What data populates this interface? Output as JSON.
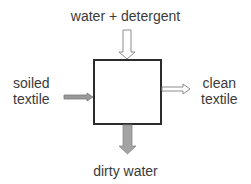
{
  "diagram": {
    "type": "process-block",
    "process_box": {
      "label": ""
    },
    "inputs": [
      {
        "id": "top",
        "lines": [
          "water + detergent"
        ],
        "arrow_style": "hollow",
        "direction": "down"
      },
      {
        "id": "left",
        "lines": [
          "soiled",
          "textile"
        ],
        "arrow_style": "filled-gray",
        "direction": "right"
      }
    ],
    "outputs": [
      {
        "id": "right",
        "lines": [
          "clean",
          "textile"
        ],
        "arrow_style": "hollow",
        "direction": "right"
      },
      {
        "id": "bottom",
        "lines": [
          "dirty water"
        ],
        "arrow_style": "filled-gray",
        "direction": "down"
      }
    ],
    "colors": {
      "box_border": "#2b2b2b",
      "filled_arrow": "#999999",
      "filled_arrow_edge": "#7a7a7a",
      "hollow_arrow_edge": "#8c8c8c",
      "text": "#3a3a3a"
    }
  }
}
